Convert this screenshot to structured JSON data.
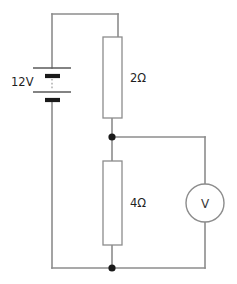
{
  "figure": {
    "name": "dc-resistive-circuit",
    "type": "schematic",
    "background_color": "#ffffff",
    "wire_color": "#8c8c8c",
    "node_color": "#1a1a1a",
    "text_color": "#1f1f1f"
  },
  "components": {
    "battery": {
      "label": "12V",
      "symbol": "multi-cell-battery",
      "position": "left-rail"
    },
    "resistor_top": {
      "label": "2Ω",
      "symbol": "rectangular-resistor",
      "position": "upper-middle-branch"
    },
    "resistor_bottom": {
      "label": "4Ω",
      "symbol": "rectangular-resistor",
      "position": "lower-middle-branch"
    },
    "voltmeter": {
      "label": "V",
      "symbol": "circle-meter",
      "position": "right-branch"
    }
  },
  "nodes": [
    {
      "name": "middle-junction",
      "x": 112,
      "y": 137
    },
    {
      "name": "bottom-junction",
      "x": 112,
      "y": 268
    }
  ]
}
